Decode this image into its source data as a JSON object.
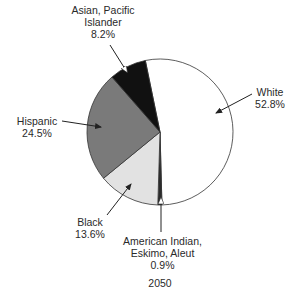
{
  "chart_data": {
    "type": "pie",
    "title": "2050",
    "categories": [
      "White",
      "American Indian, Eskimo, Aleut",
      "Black",
      "Hispanic",
      "Asian, Pacific Islander"
    ],
    "values": [
      52.8,
      0.9,
      13.6,
      24.5,
      8.2
    ],
    "value_labels": [
      "52.8%",
      "0.9%",
      "13.6%",
      "24.5%",
      "8.2%"
    ],
    "colors": [
      "#ffffff",
      "#2b2b2b",
      "#e2e2e2",
      "#7a7a7a",
      "#111111"
    ],
    "start_angle_deg": 348.4,
    "direction": "clockwise",
    "legend": "callout labels with arrows"
  },
  "labels": {
    "asian_line1": "Asian, Pacific",
    "asian_line2": "Islander",
    "asian_pct": "8.2%",
    "white_line1": "White",
    "white_pct": "52.8%",
    "hispanic_line1": "Hispanic",
    "hispanic_pct": "24.5%",
    "black_line1": "Black",
    "black_pct": "13.6%",
    "ai_line1": "American Indian,",
    "ai_line2": "Eskimo, Aleut",
    "ai_pct": "0.9%",
    "year": "2050"
  }
}
